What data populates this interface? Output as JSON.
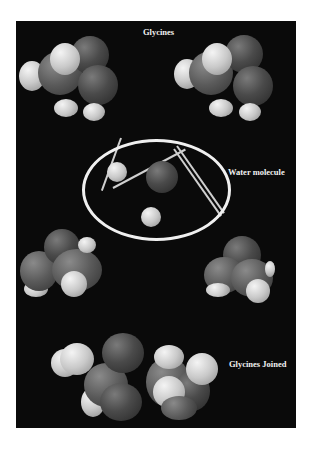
{
  "figure": {
    "background_color": "#0a0a0a",
    "labels": {
      "top": "Glycines",
      "middle": "Water molecule",
      "bottom": "Glycines Joined"
    },
    "elements": [
      {
        "name": "glycine-left",
        "type": "space-filling molecule"
      },
      {
        "name": "glycine-right",
        "type": "space-filling molecule"
      },
      {
        "name": "water-molecule",
        "type": "ball-and-stick, circled"
      },
      {
        "name": "glycine-lower-left",
        "type": "space-filling molecule"
      },
      {
        "name": "glycine-lower-right",
        "type": "space-filling molecule"
      },
      {
        "name": "glycines-joined",
        "type": "space-filling dipeptide"
      }
    ]
  }
}
